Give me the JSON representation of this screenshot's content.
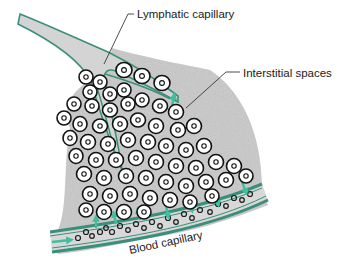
{
  "diagram": {
    "type": "anatomical-illustration",
    "labels": {
      "lymphatic_capillary": "Lymphatic capillary",
      "interstitial_spaces": "Interstitial spaces",
      "blood_capillary": "Blood capillary"
    },
    "colors": {
      "tissue_background": "#c9c9c9",
      "vessel_wall": "#3a8f7a",
      "flow_arrow": "#3fbf9f",
      "cell_fill": "#ffffff",
      "cell_outline": "#111111",
      "label_text": "#1a1a1a"
    }
  }
}
